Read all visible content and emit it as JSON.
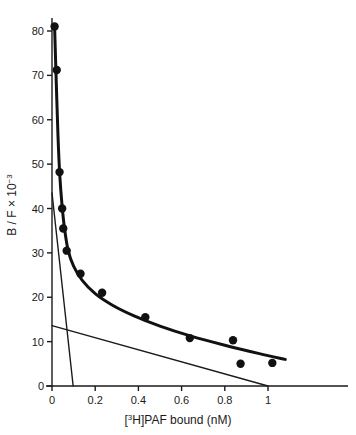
{
  "chart_data": {
    "type": "scatter",
    "title": "",
    "xlabel": "[³H]PAF bound (nM)",
    "ylabel": "B / F × 10⁻³",
    "ylabel_parts": {
      "main": "B / F × 10",
      "exponent": "−3"
    },
    "xlabel_parts": {
      "bracket_open": "[",
      "isotope": "3",
      "element": "H",
      "bracket_close": "]",
      "rest": "PAF bound (nM)"
    },
    "xlim": [
      0,
      1.15
    ],
    "ylim": [
      0,
      85
    ],
    "xticks": [
      0,
      0.2,
      0.4,
      0.6,
      0.8,
      1
    ],
    "xticklabels": [
      "0",
      "0.2",
      "0.4",
      "0.6",
      "0.8",
      "1"
    ],
    "yticks": [
      0,
      10,
      20,
      30,
      40,
      50,
      60,
      70,
      80
    ],
    "yticklabels": [
      "0",
      "10",
      "20",
      "30",
      "40",
      "50",
      "60",
      "70",
      "80"
    ],
    "grid": false,
    "legend": "none",
    "marker": "filled-circle",
    "marker_color": "#111111",
    "points": [
      {
        "x": 0.012,
        "y": 81.0
      },
      {
        "x": 0.022,
        "y": 71.2
      },
      {
        "x": 0.035,
        "y": 48.2
      },
      {
        "x": 0.047,
        "y": 40.0
      },
      {
        "x": 0.052,
        "y": 35.5
      },
      {
        "x": 0.068,
        "y": 30.5
      },
      {
        "x": 0.132,
        "y": 25.3
      },
      {
        "x": 0.232,
        "y": 21.0
      },
      {
        "x": 0.432,
        "y": 15.5
      },
      {
        "x": 0.638,
        "y": 10.8
      },
      {
        "x": 0.838,
        "y": 10.3
      },
      {
        "x": 0.873,
        "y": 5.0
      },
      {
        "x": 1.02,
        "y": 5.2
      }
    ],
    "curves": [
      {
        "name": "biphasic-binding-curve",
        "kind": "curve",
        "width": 3.0,
        "points": [
          {
            "x": 0.012,
            "y": 81.0
          },
          {
            "x": 0.02,
            "y": 68.0
          },
          {
            "x": 0.028,
            "y": 56.0
          },
          {
            "x": 0.036,
            "y": 47.5
          },
          {
            "x": 0.046,
            "y": 41.0
          },
          {
            "x": 0.058,
            "y": 35.5
          },
          {
            "x": 0.075,
            "y": 30.5
          },
          {
            "x": 0.1,
            "y": 27.0
          },
          {
            "x": 0.14,
            "y": 23.8
          },
          {
            "x": 0.2,
            "y": 20.8
          },
          {
            "x": 0.28,
            "y": 18.2
          },
          {
            "x": 0.38,
            "y": 15.8
          },
          {
            "x": 0.5,
            "y": 13.5
          },
          {
            "x": 0.64,
            "y": 11.3
          },
          {
            "x": 0.8,
            "y": 9.2
          },
          {
            "x": 0.96,
            "y": 7.3
          },
          {
            "x": 1.08,
            "y": 6.0
          }
        ]
      },
      {
        "name": "high-affinity-component-line",
        "kind": "line",
        "width": 1.4,
        "x1": 0.0,
        "y1": 43.5,
        "x2": 0.098,
        "y2": 0.0
      },
      {
        "name": "low-affinity-component-line",
        "kind": "line",
        "width": 1.4,
        "x1": 0.0,
        "y1": 13.6,
        "x2": 1.0,
        "y2": 0.0
      }
    ]
  },
  "axes": {
    "x_axis_name": "x-axis",
    "y_axis_name": "y-axis"
  }
}
